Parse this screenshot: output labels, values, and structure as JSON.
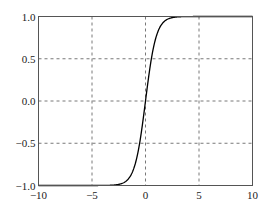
{
  "chart_data": {
    "type": "line",
    "title": "",
    "xlabel": "",
    "ylabel": "",
    "xlim": [
      -10,
      10
    ],
    "ylim": [
      -1.0,
      1.0
    ],
    "grid": true,
    "grid_style": "dashed",
    "legend": null,
    "x_ticks": [
      -10,
      -5,
      0,
      5,
      10
    ],
    "x_tick_labels": [
      "−10",
      "−5",
      "0",
      "5",
      "10"
    ],
    "y_ticks": [
      -1.0,
      -0.5,
      0.0,
      0.5,
      1.0
    ],
    "y_tick_labels": [
      "−1.0",
      "−0.5",
      "0.0",
      "0.5",
      "1.0"
    ],
    "series": [
      {
        "name": "tanh(x)",
        "color": "#000000",
        "x": [
          -10,
          -8,
          -6,
          -4,
          -3,
          -2.5,
          -2,
          -1.5,
          -1.25,
          -1,
          -0.75,
          -0.5,
          -0.25,
          0,
          0.25,
          0.5,
          0.75,
          1,
          1.25,
          1.5,
          2,
          2.5,
          3,
          4,
          6,
          8,
          10
        ],
        "y": [
          -1.0,
          -1.0,
          -1.0,
          -0.999,
          -0.995,
          -0.987,
          -0.964,
          -0.905,
          -0.848,
          -0.762,
          -0.635,
          -0.462,
          -0.245,
          0.0,
          0.245,
          0.462,
          0.635,
          0.762,
          0.848,
          0.905,
          0.964,
          0.987,
          0.995,
          0.999,
          1.0,
          1.0,
          1.0
        ]
      }
    ]
  },
  "colors": {
    "axes": "#555555",
    "grid": "#555555",
    "line": "#000000",
    "background": "#ffffff"
  }
}
